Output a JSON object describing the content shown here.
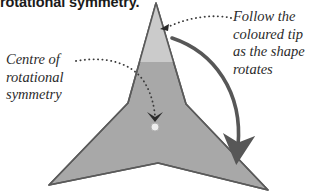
{
  "page": {
    "background_color": "#ffffff",
    "width": 324,
    "height": 194
  },
  "heading": {
    "text": "rotational symmetry.",
    "note": "partially cropped at top edge of image"
  },
  "callouts": {
    "centre": {
      "lines": [
        "Centre of",
        "rotational",
        "symmetry"
      ],
      "leader": "dotted-curve-to-centre-dot"
    },
    "follow": {
      "lines": [
        "Follow the",
        "coloured tip",
        "as the shape",
        "rotates"
      ],
      "leader": "dotted-curve-to-top-tip"
    }
  },
  "shape": {
    "name": "three-pointed-star",
    "fill_color": "#a8a8a8",
    "stroke_color": "#555555",
    "tip_highlight_color": "#cfcfcf",
    "points": [
      [
        156,
        3
      ],
      [
        186,
        104
      ],
      [
        268,
        190
      ],
      [
        158,
        163
      ],
      [
        49,
        185
      ],
      [
        128,
        103
      ]
    ],
    "order_of_rotational_symmetry": 3
  },
  "centre_marker": {
    "cx": 155,
    "cy": 127,
    "r": 4,
    "fill_color": "#efefef",
    "stroke_color": "#b5b5b5"
  },
  "rotation_arrow": {
    "color": "#575757",
    "start": [
      172,
      38
    ],
    "end": [
      240,
      155
    ],
    "direction": "clockwise"
  }
}
